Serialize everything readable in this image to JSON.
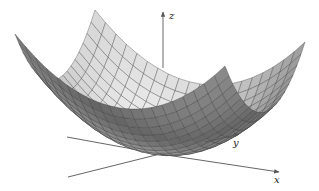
{
  "figure": {
    "surface": {
      "function": "z = x^2 + y^2",
      "grid_divisions": 20,
      "range": [
        -1,
        1
      ],
      "line_color": "#3a3a3a",
      "fill_light": "#f4f4f4",
      "fill_dark": "#555555"
    },
    "axes": {
      "x": {
        "label": "x",
        "color": "#555555"
      },
      "y": {
        "label": "y",
        "color": "#555555"
      },
      "z": {
        "label": "z",
        "color": "#555555"
      }
    }
  }
}
